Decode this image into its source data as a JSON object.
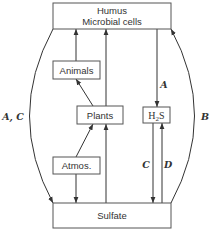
{
  "diagram": {
    "title": "",
    "nodes": {
      "humus": {
        "line1": "Humus",
        "line2": "Microbial cells"
      },
      "animals": {
        "label": "Animals"
      },
      "plants": {
        "label": "Plants"
      },
      "atmos": {
        "label": "Atmos."
      },
      "h2s": {
        "main": "H",
        "sub": "2",
        "tail": "S"
      },
      "sulfate": {
        "label": "Sulfate"
      }
    },
    "edge_labels": {
      "left_arc": "A, C",
      "right_arc": "B",
      "humus_to_h2s": "A",
      "h2s_to_sulfate": "C",
      "sulfate_to_h2s": "D"
    },
    "edges": [
      {
        "from": "Humus",
        "to": "Sulfate",
        "label": "A, C"
      },
      {
        "from": "Sulfate",
        "to": "Humus",
        "label": "B"
      },
      {
        "from": "Animals",
        "to": "Humus",
        "label": ""
      },
      {
        "from": "Plants",
        "to": "Humus",
        "label": ""
      },
      {
        "from": "Plants",
        "to": "Animals",
        "label": ""
      },
      {
        "from": "Atmos.",
        "to": "Plants",
        "label": ""
      },
      {
        "from": "Atmos.",
        "to": "Sulfate",
        "label": ""
      },
      {
        "from": "Sulfate",
        "to": "Plants",
        "label": ""
      },
      {
        "from": "Humus",
        "to": "H2S",
        "label": "A"
      },
      {
        "from": "H2S",
        "to": "Sulfate",
        "label": "C"
      },
      {
        "from": "Sulfate",
        "to": "H2S",
        "label": "D"
      }
    ]
  }
}
